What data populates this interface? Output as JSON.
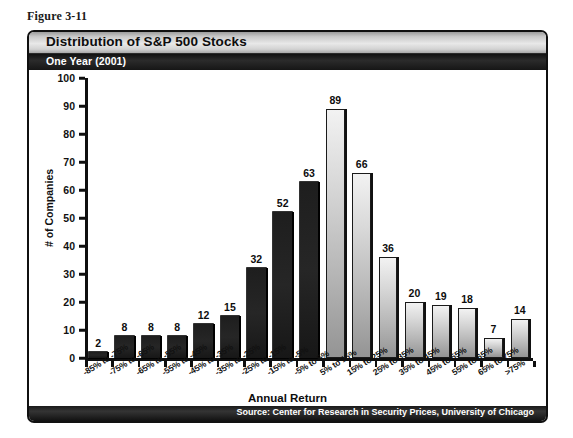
{
  "figure": {
    "caption": "Figure 3-11"
  },
  "chart_panel": {
    "title": "Distribution of S&P 500 Stocks",
    "subtitle": "One Year (2001)",
    "source": "Source: Center for Research in Security Prices, University of Chicago"
  },
  "chart_data": {
    "type": "bar",
    "title": "Distribution of S&P 500 Stocks",
    "subtitle": "One Year (2001)",
    "xlabel": "Annual Return",
    "ylabel": "# of Companies",
    "ylim": [
      0,
      100
    ],
    "ytick_values": [
      0,
      10,
      20,
      30,
      40,
      50,
      60,
      70,
      80,
      90,
      100
    ],
    "ytick_labels": [
      "0",
      "10",
      "20",
      "30",
      "40",
      "50",
      "60",
      "70",
      "80",
      "90",
      "100"
    ],
    "grid": false,
    "legend": "none",
    "categories": [
      "-85% to -75%",
      "-75% to -65%",
      "-65% to -55%",
      "-55% to -45%",
      "-45% to -35%",
      "-35% to -25%",
      "-25% to -15%",
      "-15% to -5%",
      "-5% to 5%",
      "5% to 15%",
      "15% to 25%",
      "25% to 35%",
      "35% to 45%",
      "45% to 55%",
      "55% to 65%",
      "65% to 75%",
      ">75%"
    ],
    "values": [
      2,
      8,
      8,
      8,
      12,
      15,
      32,
      52,
      63,
      89,
      66,
      36,
      20,
      19,
      18,
      7,
      14
    ],
    "bar_styles": [
      "dark",
      "dark",
      "dark",
      "dark",
      "dark",
      "dark",
      "dark",
      "dark",
      "dark",
      "light",
      "light",
      "light",
      "light",
      "light",
      "light",
      "light",
      "light"
    ],
    "data_labels": [
      "2",
      "8",
      "8",
      "8",
      "12",
      "15",
      "32",
      "52",
      "63",
      "89",
      "66",
      "36",
      "20",
      "19",
      "18",
      "7",
      "14"
    ],
    "colors": {
      "bar_dark": "#1e1e1e",
      "bar_light_top": "#f2f2f2",
      "bar_light_bottom": "#949494",
      "axis": "#0f0f0f",
      "title_bar": "#d2d2d2",
      "subtitle_bar": "#161616",
      "footer_bar": "#161616",
      "text": "#0d0d0d"
    }
  }
}
